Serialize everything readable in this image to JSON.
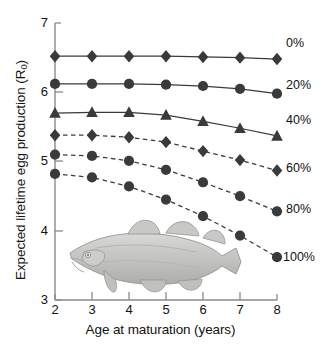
{
  "chart_data": {
    "type": "line",
    "title": "",
    "xlabel": "Age at maturation (years)",
    "ylabel": "Expected lifetime egg production (R0)",
    "ylabel_base": "Expected lifetime egg production (R",
    "ylabel_sub": "0",
    "ylabel_tail": ")",
    "x": [
      2,
      3,
      4,
      5,
      6,
      7,
      8
    ],
    "xlim": [
      2,
      8
    ],
    "ylim": [
      3,
      7
    ],
    "xticks": [
      "2",
      "3",
      "4",
      "5",
      "6",
      "7",
      "8"
    ],
    "yticks": [
      "7",
      "6",
      "5",
      "4",
      "3"
    ],
    "grid": false,
    "legend_position": "right",
    "series": [
      {
        "name": "0%",
        "marker": "diamond",
        "linestyle": "solid",
        "color": "#3a3a3a",
        "values": [
          6.52,
          6.52,
          6.52,
          6.52,
          6.51,
          6.5,
          6.48
        ]
      },
      {
        "name": "20%",
        "marker": "circle",
        "linestyle": "solid",
        "color": "#3a3a3a",
        "values": [
          6.12,
          6.12,
          6.12,
          6.11,
          6.09,
          6.05,
          5.98
        ]
      },
      {
        "name": "40%",
        "marker": "triangle",
        "linestyle": "solid",
        "color": "#3a3a3a",
        "values": [
          5.7,
          5.71,
          5.71,
          5.67,
          5.58,
          5.48,
          5.37
        ]
      },
      {
        "name": "60%",
        "marker": "diamond",
        "linestyle": "dashed",
        "color": "#3a3a3a",
        "values": [
          5.38,
          5.38,
          5.35,
          5.28,
          5.15,
          5.02,
          4.87
        ]
      },
      {
        "name": "80%",
        "marker": "circle",
        "linestyle": "dashed",
        "color": "#3a3a3a",
        "values": [
          5.1,
          5.08,
          5.01,
          4.88,
          4.7,
          4.5,
          4.28
        ]
      },
      {
        "name": "100%",
        "marker": "circle",
        "linestyle": "dashed",
        "color": "#3a3a3a",
        "values": [
          4.82,
          4.77,
          4.64,
          4.45,
          4.21,
          3.93,
          3.62
        ]
      }
    ],
    "annotation": {
      "name": "cod-fish-illustration",
      "description": "grayscale drawing of an Atlantic cod"
    }
  }
}
